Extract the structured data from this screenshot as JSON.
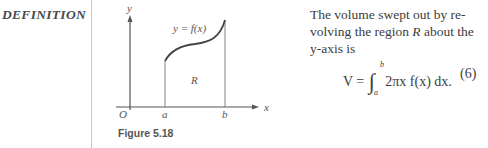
{
  "section_label": "DEFINITION",
  "figure": {
    "caption": "Figure 5.18",
    "curve_label": "y = f(x)",
    "region_label": "R",
    "axis_labels": {
      "x": "x",
      "y": "y",
      "origin": "O",
      "a": "a",
      "b": "b"
    }
  },
  "text": {
    "lines": [
      "The volume swept out by re-",
      "volving the region ",
      "R",
      " about the",
      "y-axis is"
    ]
  },
  "equation": {
    "lhs": "V =",
    "upper_limit": "b",
    "lower_limit": "a",
    "integrand": "2πx f(x) dx.",
    "number": "(6)"
  }
}
